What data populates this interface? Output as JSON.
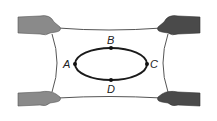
{
  "diagram": {
    "points": [
      {
        "id": "A",
        "label": "A",
        "position": "left"
      },
      {
        "id": "B",
        "label": "B",
        "position": "top"
      },
      {
        "id": "C",
        "label": "C",
        "position": "right"
      },
      {
        "id": "D",
        "label": "D",
        "position": "bottom"
      }
    ],
    "colors": {
      "hand_left": "#8a8a8a",
      "hand_right": "#4a4a4a",
      "sheet_edge": "#555555",
      "loop": "#1a1a1a"
    }
  }
}
